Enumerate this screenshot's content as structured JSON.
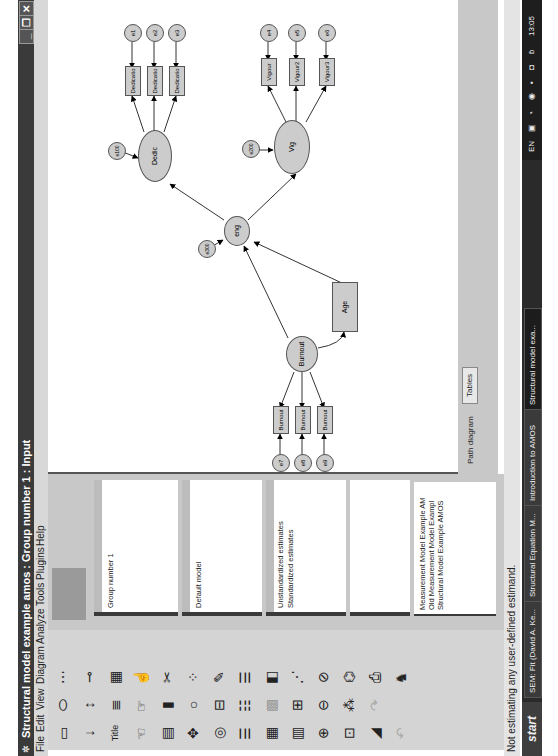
{
  "window": {
    "title": "Structural model example amos : Group number 1 : Input",
    "controls": {
      "minimize": "_",
      "restore": "❐",
      "close": "✕"
    }
  },
  "menu": [
    "File",
    "Edit",
    "View",
    "Diagram",
    "Analyze",
    "Tools",
    "Plugins",
    "Help"
  ],
  "toolbox": {
    "icons": [
      "draw-observed-variable-icon",
      "draw-unobserved-variable-icon",
      "draw-indicator-variable-icon",
      "draw-path-icon",
      "draw-covariance-icon",
      "add-unique-variable-icon",
      "figure-caption-icon",
      "list-variables-in-model-icon",
      "list-variables-in-dataset-icon",
      "select-one-object-icon",
      "select-all-objects-icon",
      "deselect-all-icon",
      "duplicate-icon",
      "move-icon",
      "erase-icon",
      "change-shape-icon",
      "rotate-indicators-icon",
      "reflect-indicators-icon",
      "move-parameters-icon",
      "reposition-icon",
      "touch-up-icon",
      "data-files-icon",
      "analysis-properties-icon",
      "calculate-estimates-icon",
      "copy-to-clipboard-icon",
      "view-text-icon",
      "save-diagram-icon",
      "object-properties-icon",
      "drag-properties-icon",
      "preserve-symmetries-icon",
      "zoom-in-icon",
      "zoom-out-icon",
      "zoom-page-icon",
      "scroll-icon",
      "loupe-icon",
      "bayesian-icon",
      "multiple-group-icon",
      "print-icon",
      "undo-icon",
      "redo-icon",
      "specification-search-icon",
      "degrees-freedom-icon"
    ]
  },
  "left_panel": {
    "groups": [
      "Group number 1"
    ],
    "models": [
      "Default model"
    ],
    "estimates": [
      "Unstandardized estimates",
      "Standardized estimates"
    ],
    "files": [
      "Measurement Model Example AM",
      "Old Measurement Model Exampl",
      "Structural Model Example AMOS"
    ]
  },
  "diagram": {
    "latent": [
      {
        "id": "Burnout",
        "label": "Burnout"
      },
      {
        "id": "eng",
        "label": "eng"
      },
      {
        "id": "Dedic",
        "label": "Dedic"
      },
      {
        "id": "Vig",
        "label": "Vig"
      }
    ],
    "observed": [
      {
        "label": "Burnout"
      },
      {
        "label": "Burnout"
      },
      {
        "label": "Burnout"
      },
      {
        "label": "Age"
      },
      {
        "label": "Dedicatio"
      },
      {
        "label": "Dedicatio"
      },
      {
        "label": "Dedicatio"
      },
      {
        "label": "Vigour"
      },
      {
        "label": "Vigour2"
      },
      {
        "label": "Vigour3"
      }
    ],
    "errors": [
      "e1",
      "e2",
      "e3",
      "e4",
      "e5",
      "e6",
      "e7",
      "e8",
      "e9",
      "e100",
      "e200",
      "e300"
    ],
    "fixed_loading": "1"
  },
  "view_tabs": [
    "Path diagram",
    "Tables"
  ],
  "status": "Not estimating any user-defined estimand.",
  "taskbar": {
    "start": "start",
    "items": [
      "SEM: Fit (David A. Ke...",
      "Structural Equation M...",
      "Introduction to AMOS",
      "Structural model exa..."
    ],
    "tray": {
      "lang": "EN",
      "time": "13:05"
    }
  }
}
